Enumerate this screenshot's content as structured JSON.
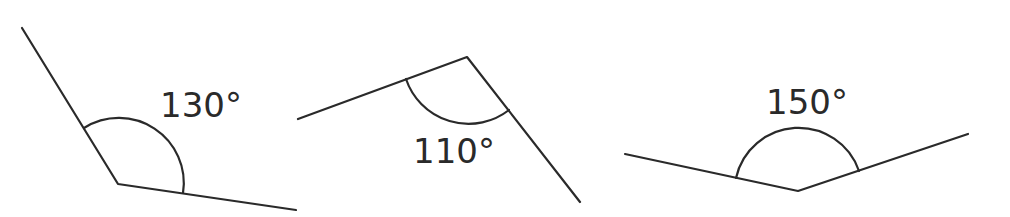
{
  "diagram": {
    "background": "#ffffff",
    "stroke_color": "#2a2a2a",
    "angles": [
      {
        "label": "130°",
        "degrees": 130,
        "vertex": [
          118,
          184
        ],
        "ray_a_end": [
          22,
          28
        ],
        "ray_b_end": [
          296,
          210
        ],
        "arc": {
          "start": [
            84,
            128
          ],
          "end": [
            183,
            193
          ],
          "radius": 65
        },
        "label_pos": [
          160,
          117
        ]
      },
      {
        "label": "110°",
        "degrees": 110,
        "vertex": [
          467,
          57
        ],
        "ray_a_end": [
          298,
          119
        ],
        "ray_b_end": [
          580,
          202
        ],
        "arc": {
          "start": [
            406,
            79
          ],
          "end": [
            509,
            110
          ],
          "radius": 66
        },
        "label_pos": [
          413,
          163
        ]
      },
      {
        "label": "150°",
        "degrees": 150,
        "vertex": [
          798,
          191
        ],
        "ray_a_end": [
          625,
          154
        ],
        "ray_b_end": [
          968,
          134
        ],
        "arc": {
          "start": [
            736,
            178
          ],
          "end": [
            859,
            171
          ],
          "radius": 64
        },
        "label_pos": [
          766,
          114
        ]
      }
    ]
  }
}
